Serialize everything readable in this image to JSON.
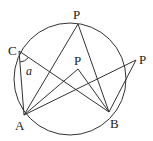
{
  "diagram": {
    "labels": {
      "C": "C",
      "A": "A",
      "B": "B",
      "P_top": "P",
      "P_inner": "P",
      "P_outer": "P",
      "angle": "a"
    },
    "colors": {
      "stroke": "#333333",
      "background": "#ffffff"
    }
  }
}
